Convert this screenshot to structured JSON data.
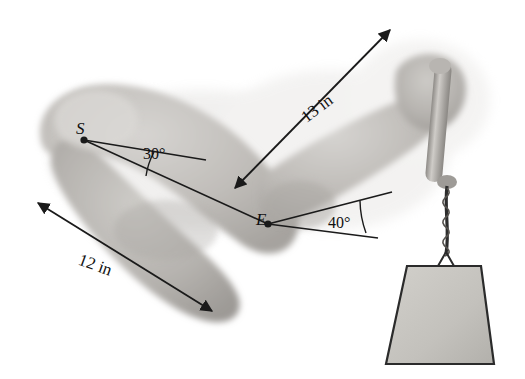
{
  "figure": {
    "background_color": "#ffffff",
    "labels": {
      "shoulder_point": "S",
      "elbow_point": "E",
      "upper_segment_length": "13 in",
      "lower_segment_length": "12 in",
      "shoulder_angle": "30°",
      "elbow_angle": "40°"
    },
    "colors": {
      "arm_fill": "#b9b6b3",
      "arm_fill_light": "#cfcdca",
      "arm_shadow": "#9b9894",
      "weight_fill": "#c6c5c0",
      "weight_stroke": "#2b2b2b",
      "line_color": "#1a1a1a",
      "text_color": "#111111"
    },
    "elements": {
      "arm_name": "shaded-arm-illustration",
      "weight_name": "hanging-weight",
      "cord_name": "weight-cord",
      "handle_name": "dumbbell-handle"
    }
  }
}
